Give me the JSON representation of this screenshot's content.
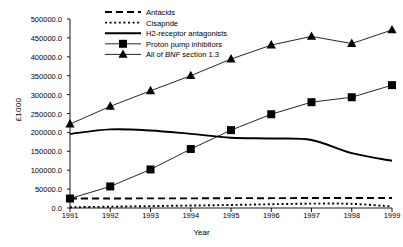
{
  "chart_data": {
    "type": "line",
    "title": "",
    "xlabel": "Year",
    "ylabel": "£1000",
    "x": [
      1991,
      1992,
      1993,
      1994,
      1995,
      1996,
      1997,
      1998,
      1999
    ],
    "xticklabels": [
      "1991",
      "1992",
      "1993",
      "1994",
      "1995",
      "1996",
      "1997",
      "1998",
      "1999"
    ],
    "yticks": [
      0,
      50000,
      100000,
      150000,
      200000,
      250000,
      300000,
      350000,
      400000,
      450000,
      500000
    ],
    "yticklabels": [
      "0.0",
      "50000.0",
      "100000.0",
      "150000.0",
      "200000.0",
      "250000.0",
      "300000.0",
      "350000.0",
      "400000.0",
      "450000.0",
      "500000.0"
    ],
    "ylim": [
      0,
      500000
    ],
    "xlim": [
      1991,
      1999
    ],
    "grid": false,
    "legend_position": "top-center",
    "series": [
      {
        "name": "Antacids",
        "style": "dashed",
        "marker": "none",
        "color": "#000000",
        "values": [
          25000,
          25000,
          25500,
          25500,
          26000,
          26000,
          26500,
          26500,
          26500
        ]
      },
      {
        "name": "Cisapride",
        "style": "dotted",
        "marker": "none",
        "color": "#000000",
        "values": [
          2000,
          3500,
          5000,
          6500,
          8000,
          10000,
          11500,
          11000,
          4000
        ]
      },
      {
        "name": "H2-receptor antagonists",
        "style": "solid",
        "marker": "none",
        "color": "#000000",
        "values": [
          196000,
          208000,
          205000,
          196000,
          186000,
          184000,
          180000,
          145000,
          125000
        ]
      },
      {
        "name": "Proton pump inhibitors",
        "style": "solid",
        "marker": "square",
        "color": "#000000",
        "values": [
          25000,
          57000,
          102000,
          156000,
          206000,
          248000,
          280000,
          293000,
          325000
        ]
      },
      {
        "name": "All of BNF section 1.3",
        "name_html": "All of <i>BNF</i> section 1.3",
        "style": "solid",
        "marker": "triangle",
        "color": "#000000",
        "values": [
          222000,
          269000,
          310000,
          350000,
          394000,
          431000,
          454000,
          435000,
          471000
        ]
      }
    ]
  }
}
